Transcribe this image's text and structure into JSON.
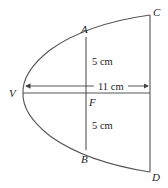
{
  "diagram": {
    "type": "parabolic reflector cross-section",
    "points": {
      "V": "V",
      "A": "A",
      "B": "B",
      "C": "C",
      "D": "D",
      "F": "F"
    },
    "measurements": {
      "upper_half_chord": "5 cm",
      "lower_half_chord": "5 cm",
      "depth": "11 cm"
    },
    "colors": {
      "line": "#555555",
      "text": "#222222",
      "background": "#ffffff"
    }
  }
}
